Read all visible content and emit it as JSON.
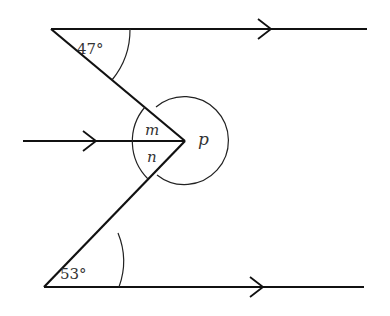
{
  "diagram": {
    "type": "parallel-lines-angles",
    "angles": {
      "top": "47°",
      "bottom": "53°",
      "m": "m",
      "n": "n",
      "p": "p"
    },
    "colors": {
      "line": "#111111",
      "background": "#ffffff"
    }
  }
}
